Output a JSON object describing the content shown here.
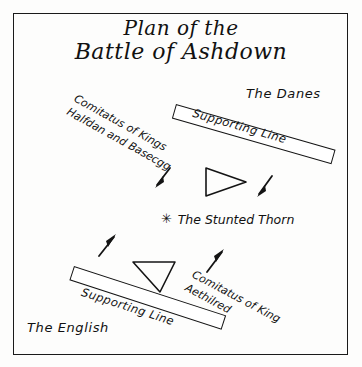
{
  "title": {
    "line1": "Plan of the",
    "line2": "Battle of Ashdown"
  },
  "colors": {
    "ink": "#111111",
    "frame": "#1a1a1a",
    "paper": "#fdfdfc"
  },
  "labels": {
    "danes": "The Danes",
    "english": "The English",
    "thorn": "The Stunted Thorn",
    "thorn_marker": "✳",
    "danes_supporting_line": "Supporting Line",
    "english_supporting_line": "Supporting Line",
    "danes_comitatus_line1": "Comitatus of Kings",
    "danes_comitatus_line2": "Halfdan and Basecgg",
    "english_comitatus_line1": "Comitatus of King",
    "english_comitatus_line2": "Aethilred"
  },
  "map_elements": {
    "bars": [
      {
        "name": "danes-supporting-line-bar",
        "side": "Danes",
        "angle_deg": 16
      },
      {
        "name": "english-supporting-line-bar",
        "side": "English",
        "angle_deg": 18
      }
    ],
    "wedges": [
      {
        "name": "danes-wedge",
        "side": "Danes",
        "points_toward": "right"
      },
      {
        "name": "english-wedge",
        "side": "English",
        "points_toward": "down-right"
      }
    ],
    "arrows": [
      {
        "name": "danes-left-advance-arrow",
        "direction": "down-left"
      },
      {
        "name": "danes-right-advance-arrow",
        "direction": "down-left"
      },
      {
        "name": "english-left-advance-arrow",
        "direction": "up-right"
      },
      {
        "name": "english-right-advance-arrow",
        "direction": "up-right"
      }
    ]
  }
}
